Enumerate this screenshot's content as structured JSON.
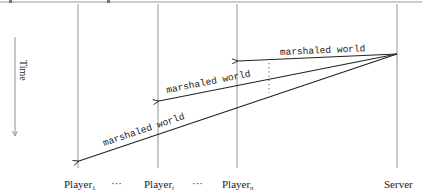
{
  "diagram": {
    "type": "sequence",
    "time_axis": {
      "label": "Time"
    },
    "participants": [
      {
        "id": "p1",
        "label": "Player",
        "subscript": "1",
        "x": 78
      },
      {
        "id": "pi",
        "label": "Player",
        "subscript": "i",
        "x": 158
      },
      {
        "id": "pn",
        "label": "Player",
        "subscript": "n",
        "x": 237
      },
      {
        "id": "server",
        "label": "Server",
        "subscript": "",
        "x": 397
      }
    ],
    "ellipses": [
      {
        "text": "···",
        "x": 118
      },
      {
        "text": "···",
        "x": 198
      }
    ],
    "messages": [
      {
        "from": "server",
        "to": "pn",
        "label": "marshaled world"
      },
      {
        "from": "server",
        "to": "pi",
        "label": "marshaled world"
      },
      {
        "from": "server",
        "to": "p1",
        "label": "marshaled world"
      }
    ]
  }
}
